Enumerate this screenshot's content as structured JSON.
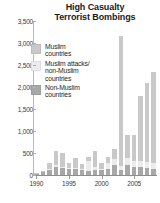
{
  "chart_data": {
    "type": "bar",
    "title": "High Casualty Terrorist Bombings",
    "title_line1": "High Casualty",
    "title_line2": "Terrorist Bombings",
    "xlabel": "",
    "ylabel": "",
    "ylim": [
      0,
      3500
    ],
    "grid": false,
    "stacked": true,
    "legend_position": "upper-left-inside",
    "ytick_labels": [
      "0",
      "500",
      "1,000",
      "1,500",
      "2,000",
      "2,500",
      "3,000",
      "3,500"
    ],
    "ytick_values": [
      0,
      500,
      1000,
      1500,
      2000,
      2500,
      3000,
      3500
    ],
    "xtick_labels": [
      "1990",
      "1995",
      "2000",
      "2005"
    ],
    "xtick_values": [
      1990,
      1995,
      2000,
      2005
    ],
    "categories": [
      1990,
      1991,
      1992,
      1993,
      1994,
      1995,
      1996,
      1997,
      1998,
      1999,
      2000,
      2001,
      2002,
      2003,
      2004,
      2005,
      2006,
      2007,
      2008
    ],
    "colors": {
      "muslim": "#c9c9c9",
      "attacks": "#ececec",
      "nonmuslim": "#a8a8a8",
      "axis": "#8d8d8d",
      "text": "#1f1f1f"
    },
    "series": [
      {
        "name": "Muslim countries",
        "key": "muslim",
        "color": "#c9c9c9",
        "values": [
          20,
          40,
          140,
          330,
          300,
          120,
          210,
          130,
          110,
          360,
          140,
          150,
          230,
          2950,
          520,
          600,
          1480,
          1800,
          2080
        ]
      },
      {
        "name": "Muslim attacks/non-Muslim countries",
        "key": "attacks",
        "color": "#ececec",
        "values": [
          0,
          0,
          20,
          30,
          40,
          20,
          30,
          20,
          220,
          80,
          20,
          130,
          130,
          90,
          150,
          120,
          120,
          130,
          130
        ]
      },
      {
        "name": "Non-Muslim countries",
        "key": "nonmuslim",
        "color": "#a8a8a8",
        "values": [
          30,
          60,
          120,
          190,
          150,
          130,
          140,
          110,
          90,
          110,
          110,
          140,
          230,
          110,
          230,
          190,
          190,
          170,
          140
        ]
      }
    ],
    "legend": [
      {
        "label_line1": "Muslim",
        "label_line2": "countries",
        "label_line3": "",
        "color": "#c9c9c9"
      },
      {
        "label_line1": "Muslim attacks/",
        "label_line2": "non-Muslim",
        "label_line3": "countries",
        "color": "#ececec"
      },
      {
        "label_line1": "Non-Muslim",
        "label_line2": "countries",
        "label_line3": "",
        "color": "#a8a8a8"
      }
    ]
  }
}
